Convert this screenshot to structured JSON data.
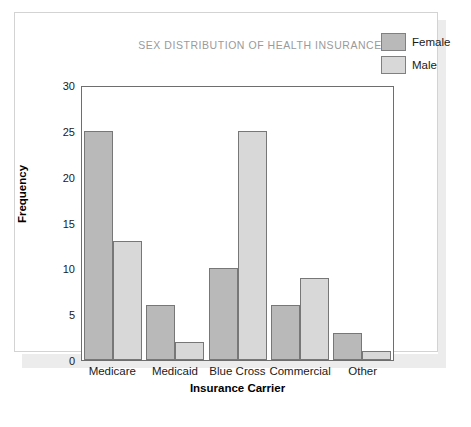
{
  "chart_data": {
    "type": "bar",
    "title": "SEX DISTRIBUTION OF HEALTH INSURANCE",
    "xlabel": "Insurance Carrier",
    "ylabel": "Frequency",
    "categories": [
      "Medicare",
      "Medicaid",
      "Blue Cross",
      "Commercial",
      "Other"
    ],
    "series": [
      {
        "name": "Female",
        "color": "#b9b9b9",
        "values": [
          25,
          6,
          10,
          6,
          3
        ]
      },
      {
        "name": "Male",
        "color": "#d8d8d8",
        "values": [
          13,
          2,
          25,
          9,
          1
        ]
      }
    ],
    "ylim": [
      0,
      30
    ],
    "yticks": [
      30,
      25,
      20,
      15,
      10,
      5,
      0
    ],
    "grid": false,
    "legend_position": "top-right"
  },
  "legend": {
    "items": [
      {
        "label": "Female",
        "color": "#b9b9b9"
      },
      {
        "label": "Male",
        "color": "#d8d8d8"
      }
    ]
  }
}
